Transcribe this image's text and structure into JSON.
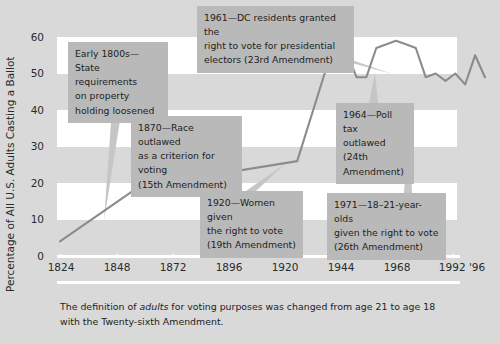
{
  "figure": {
    "background_color": "#d9d9d9",
    "band_color": "#ffffff",
    "line_color": "#8c8c8c",
    "callout_color": "#b9b9b9"
  },
  "axes": {
    "ylabel": "Percentage of All U.S. Adults Casting a Ballot",
    "yticks": [
      "60",
      "50",
      "40",
      "30",
      "20",
      "10",
      "0"
    ],
    "xticks": [
      "1824",
      "1848",
      "1872",
      "1896",
      "1920",
      "1944",
      "1968",
      "1992 '96"
    ]
  },
  "callouts": [
    {
      "id": "early-1800s",
      "line1": "Early 1800s—State",
      "line2": "requirements",
      "line3": "on property",
      "line4": "holding loosened"
    },
    {
      "id": "1870",
      "line1": "1870—Race outlawed",
      "line2": "as a criterion for voting",
      "line3": "(15th Amendment)"
    },
    {
      "id": "1961",
      "line1": "1961—DC residents granted the",
      "line2": "right to vote for presidential",
      "line3": "electors (23rd Amendment)"
    },
    {
      "id": "1964",
      "line1": "1964—Poll tax",
      "line2": "outlawed (24th",
      "line3": "Amendment)"
    },
    {
      "id": "1920",
      "line1": "1920—Women given",
      "line2": "the right to vote",
      "line3": "(19th Amendment)"
    },
    {
      "id": "1971",
      "line1": "1971—18–21-year-olds",
      "line2": "given the right to vote",
      "line3": "(26th Amendment)"
    }
  ],
  "footnote": {
    "pre": "The definition of ",
    "em": "adults",
    "post": " for voting purposes was changed from age 21 to age 18 with the Twenty-sixth Amendment."
  },
  "chart_data": {
    "type": "line",
    "title": "",
    "xlabel": "",
    "ylabel": "Percentage of All U.S. Adults Casting a Ballot",
    "xlim": [
      1824,
      1996
    ],
    "ylim": [
      0,
      60
    ],
    "ytick_values": [
      0,
      10,
      20,
      30,
      40,
      50,
      60
    ],
    "xtick_values": [
      1824,
      1848,
      1872,
      1896,
      1920,
      1944,
      1968,
      1992
    ],
    "xtick_labels": [
      "1824",
      "1848",
      "1872",
      "1896",
      "1920",
      "1944",
      "1968",
      "1992 '96"
    ],
    "grid": "alternating horizontal bands every 10 units",
    "legend": "none",
    "series": [
      {
        "name": "Percentage of all U.S. adults casting a ballot",
        "x": [
          1824,
          1856,
          1920,
          1932,
          1940,
          1944,
          1948,
          1952,
          1960,
          1964,
          1968,
          1972,
          1976,
          1980,
          1984,
          1988,
          1992,
          1996
        ],
        "values": [
          4,
          19,
          26,
          52,
          56,
          49,
          49,
          57,
          59,
          58,
          57,
          49,
          50,
          48,
          50,
          47,
          55,
          49
        ]
      }
    ],
    "annotations": [
      "Early 1800s—State requirements on property holding loosened",
      "1870—Race outlawed as a criterion for voting (15th Amendment)",
      "1920—Women given the right to vote (19th Amendment)",
      "1961—DC residents granted the right to vote for presidential electors (23rd Amendment)",
      "1964—Poll tax outlawed (24th Amendment)",
      "1971—18–21-year-olds given the right to vote (26th Amendment)"
    ]
  }
}
